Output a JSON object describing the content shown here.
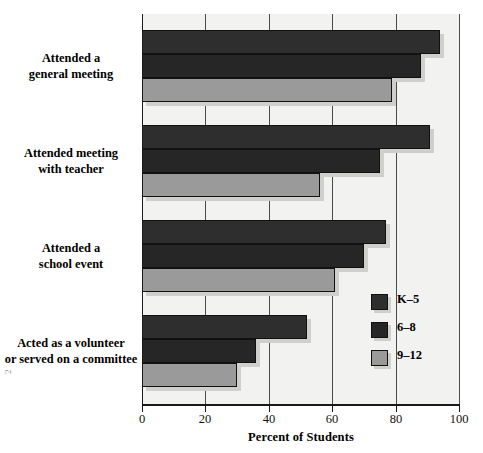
{
  "chart_data": {
    "type": "bar",
    "orientation": "horizontal",
    "title": "",
    "xlabel": "Percent of Students",
    "ylabel": "",
    "xlim": [
      0,
      100
    ],
    "xticks": [
      0,
      20,
      40,
      60,
      80,
      100
    ],
    "xticklabels": [
      "0",
      "20",
      "40",
      "60",
      "80",
      "100"
    ],
    "grid": "vertical",
    "legend_position": "center-right",
    "categories": [
      "Attended a general meeting",
      "Attended meeting with teacher",
      "Attended a school event",
      "Acted as a volunteer or served on a committee"
    ],
    "category_lines": [
      [
        "Attended a",
        "general meeting"
      ],
      [
        "Attended meeting",
        "with teacher"
      ],
      [
        "Attended a",
        "school event"
      ],
      [
        "Acted as a volunteer",
        "or served on a committee"
      ]
    ],
    "series": [
      {
        "name": "K–5",
        "color": "#2e2e2e",
        "values": [
          94,
          91,
          77,
          52
        ]
      },
      {
        "name": "6–8",
        "color": "#262626",
        "values": [
          88,
          75,
          70,
          36
        ]
      },
      {
        "name": "9–12",
        "color": "#9a9a9a",
        "values": [
          79,
          56,
          61,
          30
        ]
      }
    ]
  },
  "legend": {
    "entries": [
      {
        "label": "K–5"
      },
      {
        "label": "6–8"
      },
      {
        "label": "9–12"
      }
    ]
  },
  "axis": {
    "x_label": "Percent of Students",
    "ticks": [
      "0",
      "20",
      "40",
      "60",
      "80",
      "100"
    ]
  },
  "page_mark": "2"
}
